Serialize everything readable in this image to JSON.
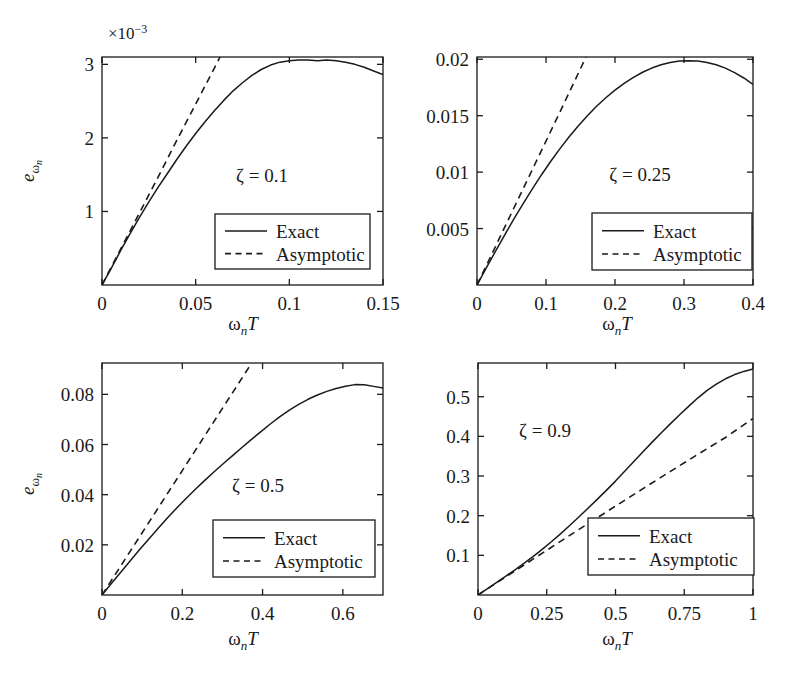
{
  "figure": {
    "background": "#ffffff",
    "ink": "#1a1a1a",
    "width": 790,
    "height": 680
  },
  "chart_data": [
    {
      "id": "panel-zeta-0p1",
      "type": "line",
      "title": "",
      "annotation": "ζ = 0.1",
      "xlabel": "ωₙT",
      "ylabel": "eωₙ",
      "y_exponent_note": "×10⁻³",
      "xlim": [
        0,
        0.15
      ],
      "ylim": [
        0,
        0.0031
      ],
      "xticks": [
        0,
        0.05,
        0.1,
        0.15
      ],
      "xticklabels": [
        "0",
        "0.05",
        "0.1",
        "0.15"
      ],
      "yticks": [
        0.001,
        0.002,
        0.003
      ],
      "yticklabels": [
        "1",
        "2",
        "3"
      ],
      "grid": false,
      "legend_position": "lower right",
      "series": [
        {
          "name": "Exact",
          "style": "solid",
          "x": [
            0,
            0.005,
            0.01,
            0.015,
            0.02,
            0.025,
            0.03,
            0.035,
            0.04,
            0.045,
            0.05,
            0.055,
            0.06,
            0.065,
            0.07,
            0.075,
            0.08,
            0.085,
            0.09,
            0.095,
            0.1,
            0.105,
            0.11,
            0.115,
            0.12,
            0.125,
            0.13,
            0.135,
            0.14,
            0.145,
            0.15
          ],
          "y": [
            0.0,
            0.00023,
            0.00047,
            0.0007,
            0.00092,
            0.00113,
            0.00133,
            0.00152,
            0.00171,
            0.00189,
            0.00206,
            0.00222,
            0.00237,
            0.00251,
            0.00264,
            0.00275,
            0.00285,
            0.00293,
            0.00299,
            0.00303,
            0.00305,
            0.00306,
            0.00306,
            0.00305,
            0.00306,
            0.00305,
            0.00303,
            0.003,
            0.00296,
            0.00291,
            0.00286
          ]
        },
        {
          "name": "Asymptotic",
          "style": "dashed",
          "x": [
            0,
            0.01,
            0.02,
            0.03,
            0.04,
            0.05,
            0.06,
            0.063
          ],
          "y": [
            0.0,
            0.00049,
            0.00098,
            0.00147,
            0.00197,
            0.00246,
            0.00295,
            0.0031
          ]
        }
      ],
      "legend": [
        "Exact",
        "Asymptotic"
      ]
    },
    {
      "id": "panel-zeta-0p25",
      "type": "line",
      "title": "",
      "annotation": "ζ = 0.25",
      "xlabel": "ωₙT",
      "ylabel": "",
      "y_exponent_note": "",
      "xlim": [
        0,
        0.4
      ],
      "ylim": [
        0,
        0.0202
      ],
      "xticks": [
        0,
        0.1,
        0.2,
        0.3,
        0.4
      ],
      "xticklabels": [
        "0",
        "0.1",
        "0.2",
        "0.3",
        "0.4"
      ],
      "yticks": [
        0.005,
        0.01,
        0.015,
        0.02
      ],
      "yticklabels": [
        "0.005",
        "0.01",
        "0.015",
        "0.02"
      ],
      "grid": false,
      "legend_position": "lower right",
      "series": [
        {
          "name": "Exact",
          "style": "solid",
          "x": [
            0,
            0.0133,
            0.0267,
            0.04,
            0.0533,
            0.0667,
            0.08,
            0.0933,
            0.1067,
            0.12,
            0.1333,
            0.1467,
            0.16,
            0.1733,
            0.1867,
            0.2,
            0.2133,
            0.2267,
            0.24,
            0.2533,
            0.2667,
            0.28,
            0.2933,
            0.3067,
            0.32,
            0.3333,
            0.3467,
            0.36,
            0.3733,
            0.3867,
            0.4
          ],
          "y": [
            0.0,
            0.0015,
            0.00297,
            0.00442,
            0.00583,
            0.00719,
            0.0085,
            0.00975,
            0.01094,
            0.01206,
            0.01311,
            0.01409,
            0.015,
            0.01583,
            0.01659,
            0.01727,
            0.01787,
            0.0184,
            0.01885,
            0.01922,
            0.01951,
            0.01972,
            0.01984,
            0.01987,
            0.01984,
            0.01972,
            0.01951,
            0.01921,
            0.01882,
            0.01834,
            0.01778
          ]
        },
        {
          "name": "Asymptotic",
          "style": "dashed",
          "x": [
            0,
            0.04,
            0.08,
            0.12,
            0.158
          ],
          "y": [
            0.0,
            0.0051,
            0.0102,
            0.0153,
            0.0202
          ]
        }
      ],
      "legend": [
        "Exact",
        "Asymptotic"
      ]
    },
    {
      "id": "panel-zeta-0p5",
      "type": "line",
      "title": "",
      "annotation": "ζ = 0.5",
      "xlabel": "ωₙT",
      "ylabel": "eωₙ",
      "y_exponent_note": "",
      "xlim": [
        0,
        0.7
      ],
      "ylim": [
        0,
        0.0925
      ],
      "xticks": [
        0,
        0.2,
        0.4,
        0.6
      ],
      "xticklabels": [
        "0",
        "0.2",
        "0.4",
        "0.6"
      ],
      "yticks": [
        0.02,
        0.04,
        0.06,
        0.08
      ],
      "yticklabels": [
        "0.02",
        "0.04",
        "0.06",
        "0.08"
      ],
      "grid": false,
      "legend_position": "lower right",
      "series": [
        {
          "name": "Exact",
          "style": "solid",
          "x": [
            0,
            0.0233,
            0.0467,
            0.07,
            0.0933,
            0.1167,
            0.14,
            0.1633,
            0.1867,
            0.21,
            0.2333,
            0.2567,
            0.28,
            0.3033,
            0.3267,
            0.35,
            0.3733,
            0.3967,
            0.42,
            0.4433,
            0.4667,
            0.49,
            0.5133,
            0.5367,
            0.56,
            0.5833,
            0.6067,
            0.63,
            0.6533,
            0.6767,
            0.7
          ],
          "y": [
            0.0,
            0.00455,
            0.00908,
            0.01357,
            0.01801,
            0.02237,
            0.02663,
            0.03077,
            0.03477,
            0.03861,
            0.04229,
            0.04582,
            0.04922,
            0.05253,
            0.05578,
            0.05899,
            0.06216,
            0.06527,
            0.06827,
            0.07109,
            0.07368,
            0.076,
            0.07803,
            0.07975,
            0.08118,
            0.08234,
            0.08325,
            0.08388,
            0.08385,
            0.08318,
            0.08257
          ]
        },
        {
          "name": "Asymptotic",
          "style": "dashed",
          "x": [
            0,
            0.1,
            0.2,
            0.3,
            0.373
          ],
          "y": [
            0.0,
            0.0248,
            0.0496,
            0.0744,
            0.0925
          ]
        }
      ],
      "legend": [
        "Exact",
        "Asymptotic"
      ]
    },
    {
      "id": "panel-zeta-0p9",
      "type": "line",
      "title": "",
      "annotation": "ζ = 0.9",
      "xlabel": "ωₙT",
      "ylabel": "",
      "y_exponent_note": "",
      "xlim": [
        0,
        1.0
      ],
      "ylim": [
        0,
        0.585
      ],
      "xticks": [
        0,
        0.25,
        0.5,
        0.75,
        1
      ],
      "xticklabels": [
        "0",
        "0.25",
        "0.5",
        "0.75",
        "1"
      ],
      "yticks": [
        0.1,
        0.2,
        0.3,
        0.4,
        0.5
      ],
      "yticklabels": [
        "0.1",
        "0.2",
        "0.3",
        "0.4",
        "0.5"
      ],
      "grid": false,
      "legend_position": "lower right",
      "series": [
        {
          "name": "Exact",
          "style": "solid",
          "x": [
            0,
            0.0333,
            0.0667,
            0.1,
            0.1333,
            0.1667,
            0.2,
            0.2333,
            0.2667,
            0.3,
            0.3333,
            0.3667,
            0.4,
            0.4333,
            0.4667,
            0.5,
            0.5333,
            0.5667,
            0.6,
            0.6333,
            0.6667,
            0.7,
            0.7333,
            0.7667,
            0.8,
            0.8333,
            0.8667,
            0.9,
            0.9333,
            0.9667,
            1.0
          ],
          "y": [
            0.0,
            0.0155,
            0.0312,
            0.047,
            0.063,
            0.0795,
            0.0968,
            0.115,
            0.1342,
            0.1543,
            0.1752,
            0.1968,
            0.2188,
            0.2412,
            0.2638,
            0.2872,
            0.3118,
            0.3365,
            0.3612,
            0.3855,
            0.4092,
            0.4322,
            0.4545,
            0.4762,
            0.4972,
            0.5158,
            0.5318,
            0.5452,
            0.5558,
            0.5638,
            0.5702
          ]
        },
        {
          "name": "Asymptotic",
          "style": "dashed",
          "x": [
            0,
            0.1,
            0.2,
            0.3,
            0.4,
            0.5,
            0.6,
            0.7,
            0.8,
            0.9,
            1.0
          ],
          "y": [
            0.0,
            0.0452,
            0.0903,
            0.1352,
            0.1798,
            0.2242,
            0.2682,
            0.3118,
            0.3548,
            0.3972,
            0.4452
          ]
        }
      ],
      "legend": [
        "Exact",
        "Asymptotic"
      ]
    }
  ]
}
